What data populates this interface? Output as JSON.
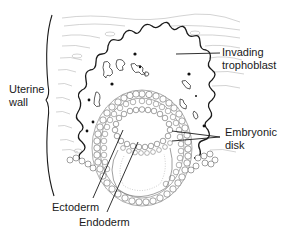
{
  "diagram": {
    "labels": {
      "uterine_wall": {
        "line1": "Uterine",
        "line2": "wall"
      },
      "invading_trophoblast": {
        "line1": "Invading",
        "line2": "trophoblast"
      },
      "embryonic_disk": {
        "line1": "Embryonic",
        "line2": "disk"
      },
      "ectoderm": "Ectoderm",
      "endoderm": "Endoderm"
    },
    "colors": {
      "line": "#1a1a1a",
      "tissue_line": "#9a9a9a",
      "cell": "#555555",
      "background": "#ffffff"
    }
  }
}
